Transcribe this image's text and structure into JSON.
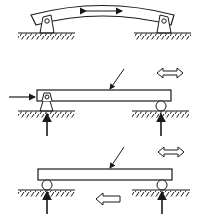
{
  "diagram": {
    "colors": {
      "stroke": "#1a1a1a",
      "fill": "#ffffff"
    },
    "panels": [
      {
        "id": "panel-1",
        "description": "Curved (bent) beam on two pin supports with double-headed movement arrow",
        "supports": [
          "pin",
          "pin"
        ],
        "arrows": [
          "double-headed-solid"
        ]
      },
      {
        "id": "panel-2",
        "description": "Straight beam on pin (left) and roller (right) support with horizontal load, vertical reactions, diagonal load pointer and hollow double arrow",
        "supports": [
          "pin",
          "roller"
        ],
        "arrows": [
          "horizontal-load",
          "vertical-reaction-left",
          "vertical-reaction-right",
          "diagonal-pointer",
          "hollow-double-arrow"
        ]
      },
      {
        "id": "panel-3",
        "description": "Straight beam on two roller supports with vertical reactions, diagonal load pointer, hollow double arrow and hollow left arrow",
        "supports": [
          "roller",
          "roller"
        ],
        "arrows": [
          "vertical-reaction-left",
          "vertical-reaction-right",
          "diagonal-pointer",
          "hollow-double-arrow",
          "hollow-left-arrow"
        ]
      }
    ]
  }
}
